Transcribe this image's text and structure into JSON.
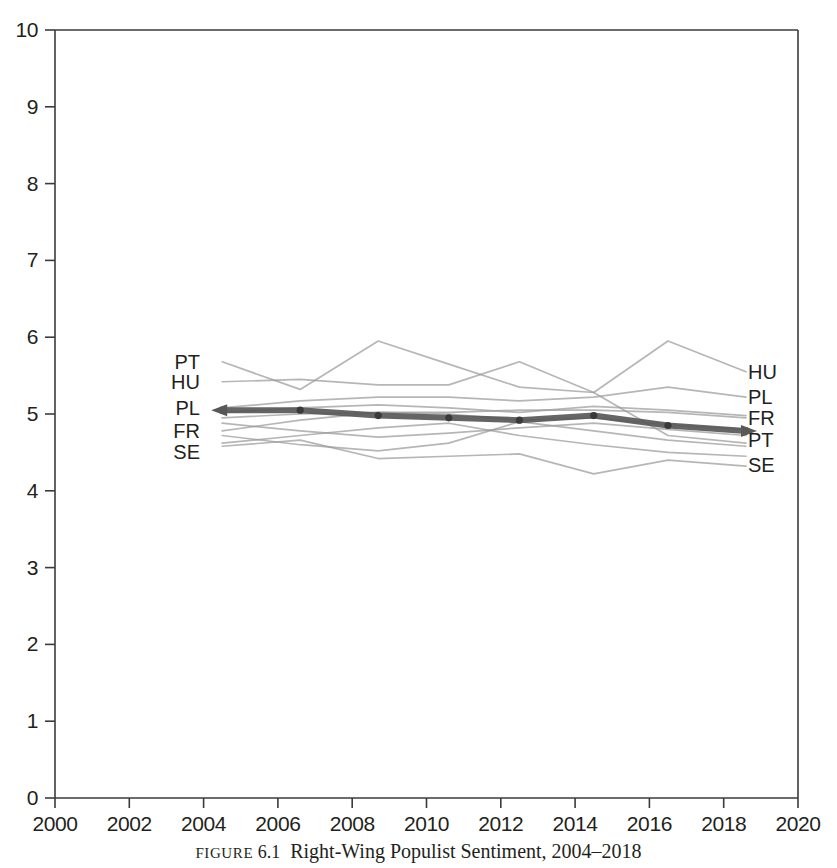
{
  "figure": {
    "caption_label": "FIGURE",
    "caption_number": "6.1",
    "caption_title": "Right-Wing Populist Sentiment, 2004–2018"
  },
  "chart_data": {
    "type": "line",
    "title": "Right-Wing Populist Sentiment, 2004–2018",
    "xlabel": "",
    "ylabel": "",
    "xlim": [
      2000,
      2020
    ],
    "ylim": [
      0,
      10
    ],
    "xticks": [
      2000,
      2002,
      2004,
      2006,
      2008,
      2010,
      2012,
      2014,
      2016,
      2018,
      2020
    ],
    "yticks": [
      0,
      1,
      2,
      3,
      4,
      5,
      6,
      7,
      8,
      9,
      10
    ],
    "grid": false,
    "legend_position": "inline-endpoints",
    "left_labels": [
      "PT",
      "HU",
      "PL",
      "FR",
      "SE"
    ],
    "right_labels": [
      "HU",
      "PL",
      "FR",
      "PT",
      "SE"
    ],
    "colors": {
      "background_series": "#9a9a9a",
      "highlight_series": "#585858",
      "axis": "#3b3b3b",
      "text": "#231f20"
    },
    "x": [
      2004.5,
      2006.6,
      2008.7,
      2010.6,
      2012.5,
      2014.5,
      2016.5,
      2018.6
    ],
    "series": [
      {
        "name": "PT",
        "emphasis": "background",
        "label_left": "PT",
        "label_right": "PT",
        "values": [
          5.68,
          5.32,
          5.95,
          5.65,
          5.35,
          5.28,
          4.72,
          4.62
        ]
      },
      {
        "name": "HU",
        "emphasis": "background",
        "label_left": "HU",
        "label_right": "HU",
        "values": [
          5.42,
          5.45,
          5.38,
          5.38,
          5.68,
          5.28,
          5.95,
          5.55
        ]
      },
      {
        "name": "PL",
        "emphasis": "background",
        "label_left": "PL",
        "label_right": "PL",
        "values": [
          5.08,
          5.17,
          5.22,
          5.22,
          5.17,
          5.22,
          5.35,
          5.22
        ]
      },
      {
        "name": "FR",
        "emphasis": "background",
        "label_left": "FR",
        "label_right": "FR",
        "values": [
          4.78,
          4.92,
          5.02,
          5.02,
          5.05,
          5.05,
          5.02,
          4.95
        ]
      },
      {
        "name": "SE",
        "emphasis": "background",
        "label_left": "SE",
        "label_right": "SE",
        "values": [
          4.58,
          4.66,
          4.42,
          4.45,
          4.48,
          4.22,
          4.4,
          4.32
        ]
      },
      {
        "name": "series-6",
        "emphasis": "background",
        "label_left": "",
        "label_right": "",
        "values": [
          4.95,
          5.0,
          5.02,
          5.0,
          4.92,
          4.95,
          4.86,
          4.8
        ]
      },
      {
        "name": "series-7",
        "emphasis": "background",
        "label_left": "",
        "label_right": "",
        "values": [
          4.88,
          4.78,
          4.7,
          4.75,
          4.82,
          4.88,
          4.8,
          4.72
        ]
      },
      {
        "name": "series-8",
        "emphasis": "background",
        "label_left": "",
        "label_right": "",
        "values": [
          4.72,
          4.6,
          4.52,
          4.62,
          4.9,
          4.78,
          4.66,
          4.58
        ]
      },
      {
        "name": "series-9",
        "emphasis": "background",
        "label_left": "",
        "label_right": "",
        "values": [
          4.62,
          4.72,
          4.82,
          4.88,
          4.72,
          4.6,
          4.5,
          4.45
        ]
      },
      {
        "name": "series-10",
        "emphasis": "background",
        "label_left": "",
        "label_right": "",
        "values": [
          5.02,
          5.08,
          5.12,
          5.08,
          5.02,
          5.1,
          5.05,
          4.98
        ]
      },
      {
        "name": "average",
        "emphasis": "highlight",
        "label_left": "",
        "label_right": "",
        "markers": true,
        "values": [
          5.05,
          5.05,
          4.98,
          4.95,
          4.92,
          4.98,
          4.85,
          4.78
        ]
      }
    ]
  },
  "axes": {
    "y_tick_labels": [
      "10",
      "9",
      "8",
      "7",
      "6",
      "5",
      "4",
      "3",
      "2",
      "1",
      "0"
    ],
    "x_tick_labels": [
      "2000",
      "2002",
      "2004",
      "2006",
      "2008",
      "2010",
      "2012",
      "2014",
      "2016",
      "2018",
      "2020"
    ]
  },
  "labels": {
    "left": [
      {
        "text": "PT",
        "y_value": 5.68
      },
      {
        "text": "HU",
        "y_value": 5.42
      },
      {
        "text": "PL",
        "y_value": 5.08
      },
      {
        "text": "FR",
        "y_value": 4.78
      },
      {
        "text": "SE",
        "y_value": 4.5
      }
    ],
    "right": [
      {
        "text": "HU",
        "y_value": 5.55
      },
      {
        "text": "PL",
        "y_value": 5.22
      },
      {
        "text": "FR",
        "y_value": 4.95
      },
      {
        "text": "PT",
        "y_value": 4.66
      },
      {
        "text": "SE",
        "y_value": 4.34
      }
    ]
  }
}
